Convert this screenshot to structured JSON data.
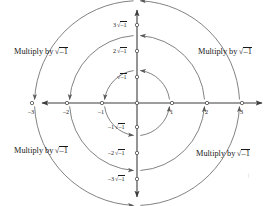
{
  "figure": {
    "background_color": "#ffffff",
    "stroke_color": "#4a4a4a",
    "text_color": "#1a1a1a",
    "width": 277,
    "height": 206
  },
  "origin": {
    "x": 137,
    "y": 103
  },
  "unit": 35,
  "axes": {
    "x_axis_name": "real-axis",
    "y_axis_name": "imaginary-axis",
    "x_range": [
      -3.6,
      3.6
    ],
    "y_range": [
      -3.6,
      3.6
    ]
  },
  "x_ticks": [
    {
      "value": -3,
      "label": "–3"
    },
    {
      "value": -2,
      "label": "–2"
    },
    {
      "value": -1,
      "label": "–1"
    },
    {
      "value": 1,
      "label": "1"
    },
    {
      "value": 2,
      "label": "2"
    },
    {
      "value": 3,
      "label": "3"
    }
  ],
  "y_ticks": [
    {
      "value": 3,
      "coefficient": "3",
      "sign": "",
      "radicand": "–1"
    },
    {
      "value": 2,
      "coefficient": "2",
      "sign": "",
      "radicand": "–1"
    },
    {
      "value": 1,
      "coefficient": "",
      "sign": "",
      "radicand": "–1"
    },
    {
      "value": -1,
      "coefficient": "1",
      "sign": "–",
      "radicand": "–1"
    },
    {
      "value": -2,
      "coefficient": "2",
      "sign": "–",
      "radicand": "–1"
    },
    {
      "value": -3,
      "coefficient": "3",
      "sign": "–",
      "radicand": "–1"
    }
  ],
  "y_tick_labels": [
    "3√–1",
    "2√–1",
    "√–1",
    "–1√–1",
    "–2√–1",
    "–3√–1"
  ],
  "quadrant_labels": [
    {
      "id": "top-left",
      "prefix": "Multiply by",
      "radicand": "–1",
      "x": 14,
      "y": 47
    },
    {
      "id": "top-right",
      "prefix": "Multiply by",
      "radicand": "–1",
      "x": 198,
      "y": 47
    },
    {
      "id": "bottom-left",
      "prefix": "Multiply by",
      "radicand": "–1",
      "x": 14,
      "y": 146
    },
    {
      "id": "bottom-right",
      "prefix": "Multiply by",
      "radicand": "–1",
      "x": 196,
      "y": 149
    }
  ],
  "arcs": [
    {
      "radius_units": 1,
      "quadrant": "Q1",
      "direction": "counterclockwise",
      "from": "1",
      "to": "√–1"
    },
    {
      "radius_units": 1,
      "quadrant": "Q2",
      "direction": "counterclockwise",
      "from": "√–1",
      "to": "–1"
    },
    {
      "radius_units": 1,
      "quadrant": "Q3",
      "direction": "counterclockwise",
      "from": "–1",
      "to": "–1√–1"
    },
    {
      "radius_units": 1,
      "quadrant": "Q4",
      "direction": "counterclockwise",
      "from": "–1√–1",
      "to": "1"
    },
    {
      "radius_units": 2,
      "quadrant": "Q1",
      "direction": "counterclockwise",
      "from": "2",
      "to": "2√–1"
    },
    {
      "radius_units": 2,
      "quadrant": "Q2",
      "direction": "counterclockwise",
      "from": "2√–1",
      "to": "–2"
    },
    {
      "radius_units": 2,
      "quadrant": "Q3",
      "direction": "counterclockwise",
      "from": "–2",
      "to": "–2√–1"
    },
    {
      "radius_units": 2,
      "quadrant": "Q4",
      "direction": "counterclockwise",
      "from": "–2√–1",
      "to": "2"
    },
    {
      "radius_units": 3,
      "quadrant": "Q1",
      "direction": "counterclockwise",
      "from": "3",
      "to": "3√–1"
    },
    {
      "radius_units": 3,
      "quadrant": "Q2",
      "direction": "counterclockwise",
      "from": "3√–1",
      "to": "–3"
    },
    {
      "radius_units": 3,
      "quadrant": "Q3",
      "direction": "counterclockwise",
      "from": "–3",
      "to": "–3√–1"
    },
    {
      "radius_units": 3,
      "quadrant": "Q4",
      "direction": "counterclockwise",
      "from": "–3√–1",
      "to": "3"
    }
  ],
  "artifact": {
    "glyph": "⌇"
  }
}
